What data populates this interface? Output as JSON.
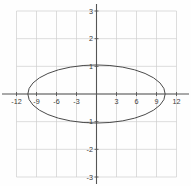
{
  "chart_data": {
    "type": "line",
    "title": "",
    "subtitle": "",
    "xlabel": "",
    "ylabel": "",
    "xlim": [
      -12,
      12
    ],
    "ylim": [
      -3,
      3
    ],
    "grid": true,
    "grid_step_x": 3,
    "grid_step_y": 1,
    "legend": "none",
    "axis_color": "#555555",
    "grid_color": "#cfcfcf",
    "curve_color": "#4a4a4a",
    "background_color": "#fefefe",
    "x_ticks": [
      {
        "value": -12,
        "label": "-12"
      },
      {
        "value": -9,
        "label": "-9"
      },
      {
        "value": -6,
        "label": "-6"
      },
      {
        "value": -3,
        "label": "-3"
      },
      {
        "value": 3,
        "label": "3"
      },
      {
        "value": 6,
        "label": "6"
      },
      {
        "value": 9,
        "label": "9"
      },
      {
        "value": 12,
        "label": "12"
      }
    ],
    "y_ticks": [
      {
        "value": 3,
        "label": "3"
      },
      {
        "value": 2,
        "label": "2"
      },
      {
        "value": 1,
        "label": "1"
      },
      {
        "value": -1,
        "label": "-1"
      },
      {
        "value": -2,
        "label": "-2"
      },
      {
        "value": -3,
        "label": "-3"
      }
    ],
    "series": [
      {
        "name": "ellipse",
        "shape": "ellipse",
        "center": [
          0,
          0
        ],
        "semi_axis_x": 10.3,
        "semi_axis_y": 1.05,
        "vertices": [
          [
            -10.3,
            0
          ],
          [
            10.3,
            0
          ]
        ],
        "co_vertices": [
          [
            0,
            1.05
          ],
          [
            0,
            -1.05
          ]
        ]
      }
    ]
  }
}
